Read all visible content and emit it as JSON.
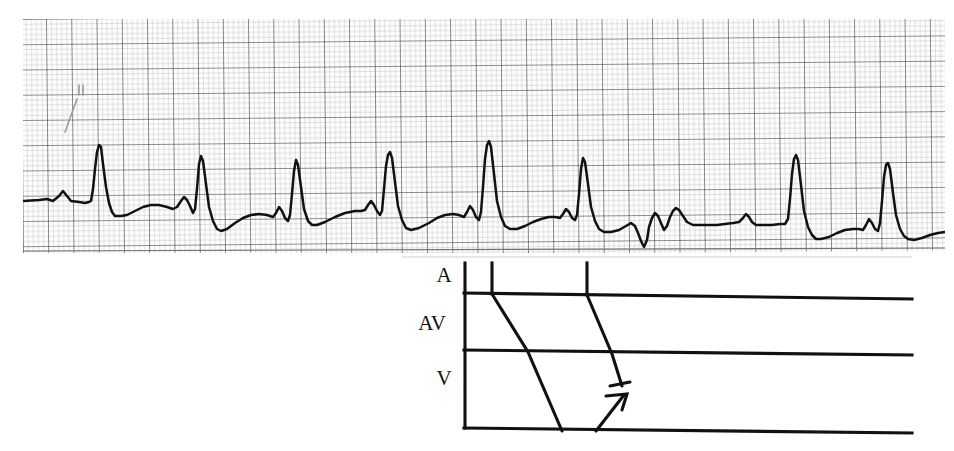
{
  "figure": {
    "kind": "ecg-rhythm-strip-with-ladder-diagram",
    "background_color": "#ffffff",
    "paper_color": "#fdfdfb"
  },
  "ecg": {
    "name": "rhythm-strip",
    "grid": {
      "small_box_px": 5.05,
      "large_box_px": 25.25,
      "small_line_color": "#8d8d93",
      "large_line_color": "#3a3a40",
      "small_line_width": 0.45,
      "large_line_width": 1.0
    },
    "trace": {
      "color": "#111111",
      "width": 2.4,
      "baseline_y": 200,
      "skew_deg": -0.7
    },
    "beats": [
      {
        "label": "beat-1",
        "qrs_x": 78,
        "qrs_peak_y": 148,
        "type": "sinus-conducted"
      },
      {
        "label": "beat-2",
        "qrs_x": 175,
        "qrs_peak_y": 158,
        "type": "sinus-conducted"
      },
      {
        "label": "beat-3",
        "qrs_x": 255,
        "qrs_peak_y": 162,
        "type": "sinus-conducted"
      },
      {
        "label": "beat-4",
        "qrs_x": 345,
        "qrs_peak_y": 153,
        "type": "sinus-conducted"
      },
      {
        "label": "beat-5",
        "qrs_x": 437,
        "qrs_peak_y": 145,
        "type": "sinus-conducted"
      },
      {
        "label": "beat-6",
        "qrs_x": 528,
        "qrs_peak_y": 158,
        "type": "sinus-conducted"
      },
      {
        "label": "beat-7",
        "qrs_x": 705,
        "qrs_peak_y": 160,
        "type": "escape-after-pause"
      },
      {
        "label": "beat-8",
        "qrs_x": 798,
        "qrs_peak_y": 163,
        "type": "sinus-conducted"
      },
      {
        "label": "beat-9",
        "qrs_x": 890,
        "qrs_peak_y": 157,
        "type": "sinus-conducted"
      }
    ],
    "events": [
      {
        "label": "non-conducted-atrial-activity",
        "x_range": [
          600,
          650
        ]
      }
    ]
  },
  "ladder": {
    "name": "lewis-ladder-diagram",
    "line_color": "#111111",
    "tiers": [
      {
        "id": "A",
        "label": "A",
        "label_x": 42,
        "top": 38,
        "bottom": 95
      },
      {
        "id": "AV",
        "label": "AV",
        "label_x": 18,
        "top": 95,
        "bottom": 152
      },
      {
        "id": "V",
        "label": "V",
        "label_x": 42,
        "top": 152,
        "bottom": 230
      }
    ],
    "left_rail_x": 65,
    "right_edge_x": 512,
    "atrial_ticks": [
      92,
      187
    ],
    "conduction_paths": [
      {
        "id": "conducted-beat",
        "blocked": false
      },
      {
        "id": "blocked-beat-with-echo",
        "blocked": true
      }
    ]
  }
}
